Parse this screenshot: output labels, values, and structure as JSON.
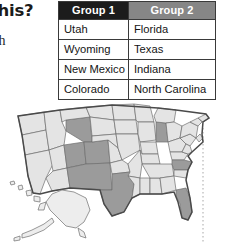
{
  "text_fragments": {
    "question": "this?",
    "instruction": "ach"
  },
  "table": {
    "headers": [
      "Group 1",
      "Group 2"
    ],
    "header_colors": [
      "#1c1c1c",
      "#868686"
    ],
    "rows": [
      [
        "Utah",
        "Florida"
      ],
      [
        "Wyoming",
        "Texas"
      ],
      [
        "New Mexico",
        "Indiana"
      ],
      [
        "Colorado",
        "North Carolina"
      ]
    ]
  },
  "map": {
    "name": "united-states-map",
    "highlighted_states": [
      "Wyoming",
      "Utah",
      "Colorado",
      "New Mexico",
      "Texas",
      "Indiana",
      "North Carolina",
      "Florida"
    ],
    "highlight_color": "#9b9b9b",
    "plain_color": "#e4e4e4",
    "insets": [
      "Alaska",
      "Hawaii"
    ]
  }
}
